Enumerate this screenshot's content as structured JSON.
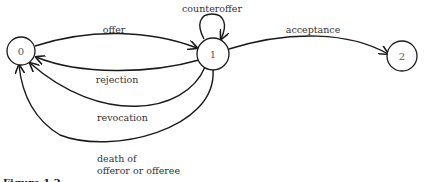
{
  "diagram": {
    "type": "state-transition",
    "nodes": [
      {
        "id": "0",
        "label": "0"
      },
      {
        "id": "1",
        "label": "1"
      },
      {
        "id": "2",
        "label": "2"
      }
    ],
    "edges": [
      {
        "from": "0",
        "to": "1",
        "label": "offer"
      },
      {
        "from": "1",
        "to": "1",
        "label": "counteroffer"
      },
      {
        "from": "1",
        "to": "2",
        "label": "acceptance"
      },
      {
        "from": "1",
        "to": "0",
        "label": "rejection"
      },
      {
        "from": "1",
        "to": "0",
        "label": "revocation"
      },
      {
        "from": "1",
        "to": "0",
        "label_line1": "death of",
        "label_line2": "offeror or offeree"
      }
    ],
    "caption": "Figure 1.2"
  }
}
